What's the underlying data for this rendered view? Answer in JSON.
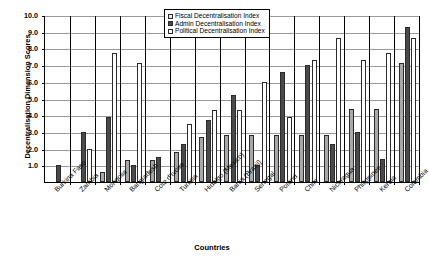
{
  "chart_data": {
    "type": "bar",
    "title": "",
    "xlabel": "Countries",
    "ylabel": "Decentralisation Dimension Scores",
    "ylim": [
      0,
      10
    ],
    "ytick_step": 1,
    "ytick_labels": [
      "10.0",
      "9.0",
      "8.0",
      "7.0",
      "6.0",
      "5.0",
      "4.0",
      "3.0",
      "2.0",
      "1.0"
    ],
    "grid": true,
    "legend_position": "top-center",
    "categories": [
      "Burkina Faso",
      "Zambia",
      "Mongolia",
      "Bangladesh",
      "Cote d'Ivoire",
      "Tunisia",
      "Hidalgo (Mexico)",
      "Bahia (Brazil)",
      "Senegal",
      "Poland",
      "Chile",
      "Nicaragua",
      "Philippines",
      "Kerala",
      "Colombia"
    ],
    "series": [
      {
        "name": "Fiscal Decentralisation Index",
        "color": "#a8a8a8",
        "values": [
          0.0,
          0.0,
          0.6,
          1.3,
          1.3,
          1.8,
          2.7,
          2.8,
          2.8,
          2.8,
          2.8,
          2.8,
          4.4,
          4.4,
          7.1
        ]
      },
      {
        "name": "Admin Decentralisation Index",
        "color": "#4a4a4a",
        "values": [
          1.0,
          3.0,
          3.9,
          1.0,
          1.5,
          2.3,
          3.7,
          5.2,
          1.0,
          6.6,
          7.0,
          2.3,
          3.0,
          1.4,
          9.3
        ]
      },
      {
        "name": "Political Decentralisation Index",
        "color": "#ffffff",
        "values": [
          0.0,
          2.0,
          7.7,
          7.1,
          0.0,
          3.5,
          4.3,
          4.3,
          6.0,
          3.9,
          7.3,
          8.6,
          7.3,
          7.7,
          8.6
        ]
      }
    ]
  },
  "legend": {
    "items": [
      {
        "label": "Fiscal Decentralisation Index",
        "swatch": "fiscal"
      },
      {
        "label": "Admin Decentralisation Index",
        "swatch": "admin"
      },
      {
        "label": "Political Decentralisation Index",
        "swatch": "political"
      }
    ]
  }
}
